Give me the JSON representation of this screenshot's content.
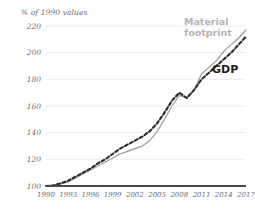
{
  "chart": {
    "axis_title": "% of 1990 values",
    "label_material_line1": "Material",
    "label_material_line2": "footprint",
    "label_gdp": "GDP"
  },
  "chart_data": {
    "type": "line",
    "title": "",
    "subtitle": "",
    "xlabel": "",
    "ylabel": "% of 1990 values",
    "grid": true,
    "legend_position": "inline-annotations",
    "xlim": [
      1990,
      2017
    ],
    "ylim": [
      100,
      220
    ],
    "yticks": [
      100,
      120,
      140,
      160,
      180,
      200,
      220
    ],
    "xticks": [
      1990,
      1993,
      1996,
      1999,
      2002,
      2005,
      2008,
      2011,
      2014,
      2017
    ],
    "x": [
      1990,
      1991,
      1992,
      1993,
      1994,
      1995,
      1996,
      1997,
      1998,
      1999,
      2000,
      2001,
      2002,
      2003,
      2004,
      2005,
      2006,
      2007,
      2008,
      2009,
      2010,
      2011,
      2012,
      2013,
      2014,
      2015,
      2016,
      2017
    ],
    "series": [
      {
        "name": "Material footprint",
        "style": "solid",
        "color": "#9a9a9a",
        "values": [
          100,
          100.5,
          101.5,
          103,
          106,
          109,
          112,
          115,
          118,
          121,
          124,
          126,
          128,
          130,
          134,
          141,
          150,
          160,
          168,
          166,
          172,
          184,
          189,
          194,
          201,
          206,
          211,
          217
        ]
      },
      {
        "name": "GDP",
        "style": "dashed",
        "color": "#2b2b2b",
        "values": [
          100,
          100.5,
          102,
          104,
          107,
          110,
          113,
          117,
          120,
          124,
          128,
          131,
          134,
          137,
          141,
          147,
          155,
          164,
          170,
          166,
          172,
          180,
          185,
          190,
          195,
          200,
          206,
          212
        ]
      }
    ]
  }
}
